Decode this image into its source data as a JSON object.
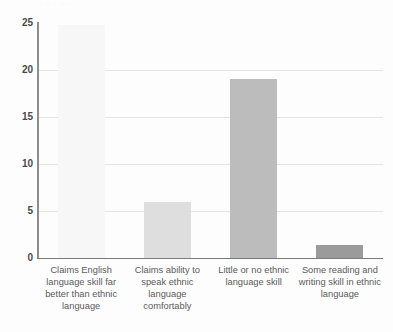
{
  "title_remnant": "· ·  ·· ·    ···",
  "axis": {
    "y_ticks": [
      "25",
      "20",
      "15",
      "10",
      "5",
      "0"
    ],
    "y_min": 0,
    "y_max": 25,
    "y_step": 5
  },
  "categories": [
    "Claims English language skill far better than ethnic language",
    "Claims ability to speak ethnic language comfortably",
    "Little or no ethnic language skill",
    "Some reading and writing skill in ethnic language"
  ],
  "bar_colors": [
    "#f7f7f7",
    "#dedede",
    "#bcbcbc",
    "#9b9b9b"
  ],
  "colors": {
    "gridline": "#e4e4e4",
    "axis_line": "#8d8d8d",
    "baseline": "#7a7a7a",
    "tick_text": "#4a4a4a",
    "label_text": "#5b5b5b",
    "background": "#fdfdfd"
  },
  "chart_data": {
    "type": "bar",
    "title": "",
    "xlabel": "",
    "ylabel": "",
    "ylim": [
      0,
      25
    ],
    "yticks": [
      0,
      5,
      10,
      15,
      20,
      25
    ],
    "grid": true,
    "legend": "none",
    "categories": [
      "Claims English language skill far better than ethnic language",
      "Claims ability to speak ethnic language comfortably",
      "Little or no ethnic language skill",
      "Some reading and writing skill in ethnic language"
    ],
    "values": [
      24.8,
      6.0,
      19.0,
      1.4
    ]
  }
}
